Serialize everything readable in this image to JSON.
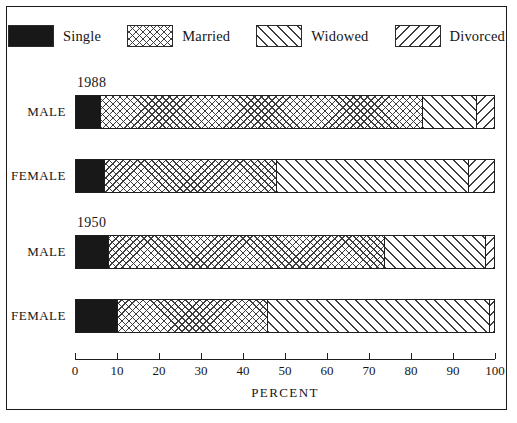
{
  "legend": {
    "items": [
      {
        "label": "Single",
        "pattern": "solid-black",
        "icon": "legend-swatch-icon"
      },
      {
        "label": "Married",
        "pattern": "cross-hatch",
        "icon": "legend-swatch-icon"
      },
      {
        "label": "Widowed",
        "pattern": "diagonal-forward",
        "icon": "legend-swatch-icon"
      },
      {
        "label": "Divorced",
        "pattern": "diagonal-back",
        "icon": "legend-swatch-icon"
      }
    ]
  },
  "axis": {
    "title": "PERCENT",
    "ticks": [
      "0",
      "10",
      "20",
      "30",
      "40",
      "50",
      "60",
      "70",
      "80",
      "90",
      "100"
    ]
  },
  "groups": [
    {
      "year": "1988",
      "rows": [
        "MALE",
        "FEMALE"
      ]
    },
    {
      "year": "1950",
      "rows": [
        "MALE",
        "FEMALE"
      ]
    }
  ],
  "caption": "",
  "chart_data": {
    "type": "bar",
    "orientation": "horizontal",
    "stacked": true,
    "title": "",
    "xlabel": "PERCENT",
    "ylabel": "",
    "xlim": [
      0,
      100
    ],
    "grid": false,
    "legend_position": "top",
    "categories": [
      "1988 MALE",
      "1988 FEMALE",
      "1950 MALE",
      "1950 FEMALE"
    ],
    "series": [
      {
        "name": "Single",
        "values": [
          6,
          7,
          8,
          10
        ]
      },
      {
        "name": "Married",
        "values": [
          77,
          41,
          66,
          36
        ]
      },
      {
        "name": "Widowed",
        "values": [
          13,
          46,
          24,
          53
        ]
      },
      {
        "name": "Divorced",
        "values": [
          4,
          6,
          2,
          1
        ]
      }
    ],
    "bars": [
      {
        "group": "1988",
        "row": "MALE",
        "segments": [
          {
            "name": "Single",
            "value": 6,
            "pattern": "solid-black",
            "cum": 6
          },
          {
            "name": "Married",
            "value": 77,
            "pattern": "cross-hatch",
            "cum": 83
          },
          {
            "name": "Widowed",
            "value": 13,
            "pattern": "diagonal-forward",
            "cum": 96
          },
          {
            "name": "Divorced",
            "value": 4,
            "pattern": "diagonal-back",
            "cum": 100
          }
        ]
      },
      {
        "group": "1988",
        "row": "FEMALE",
        "segments": [
          {
            "name": "Single",
            "value": 7,
            "pattern": "solid-black",
            "cum": 7
          },
          {
            "name": "Married",
            "value": 41,
            "pattern": "cross-hatch",
            "cum": 48
          },
          {
            "name": "Widowed",
            "value": 46,
            "pattern": "diagonal-forward",
            "cum": 94
          },
          {
            "name": "Divorced",
            "value": 6,
            "pattern": "diagonal-back",
            "cum": 100
          }
        ]
      },
      {
        "group": "1950",
        "row": "MALE",
        "segments": [
          {
            "name": "Single",
            "value": 8,
            "pattern": "solid-black",
            "cum": 8
          },
          {
            "name": "Married",
            "value": 66,
            "pattern": "cross-hatch",
            "cum": 74
          },
          {
            "name": "Widowed",
            "value": 24,
            "pattern": "diagonal-forward",
            "cum": 98
          },
          {
            "name": "Divorced",
            "value": 2,
            "pattern": "diagonal-back",
            "cum": 100
          }
        ]
      },
      {
        "group": "1950",
        "row": "FEMALE",
        "segments": [
          {
            "name": "Single",
            "value": 10,
            "pattern": "solid-black",
            "cum": 10
          },
          {
            "name": "Married",
            "value": 36,
            "pattern": "cross-hatch",
            "cum": 46
          },
          {
            "name": "Widowed",
            "value": 53,
            "pattern": "diagonal-forward",
            "cum": 99
          },
          {
            "name": "Divorced",
            "value": 1,
            "pattern": "diagonal-back",
            "cum": 100
          }
        ]
      }
    ]
  }
}
